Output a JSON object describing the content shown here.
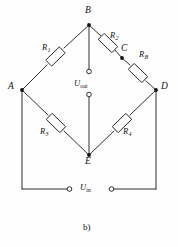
{
  "figure": {
    "kind": "wheatstone-bridge-circuit-diagram",
    "caption": "b)",
    "background_color": "#fefefe",
    "line_color": "#1a1a1a"
  },
  "nodes": [
    {
      "id": "B",
      "label": "B",
      "x": 89,
      "y": 25,
      "label_x": 86,
      "label_y": 7
    },
    {
      "id": "A",
      "label": "A",
      "x": 22,
      "y": 90,
      "label_x": 9,
      "label_y": 83
    },
    {
      "id": "C",
      "label": "C",
      "x": 122,
      "y": 58,
      "label_x": 122,
      "label_y": 46
    },
    {
      "id": "D",
      "label": "D",
      "x": 156,
      "y": 90,
      "label_x": 161,
      "label_y": 83
    },
    {
      "id": "E",
      "label": "E",
      "x": 89,
      "y": 155,
      "label_x": 86,
      "label_y": 158
    }
  ],
  "resistors": [
    {
      "id": "R1",
      "label": "R",
      "sub": "1",
      "label_x": 44,
      "label_y": 46
    },
    {
      "id": "R2",
      "label": "R",
      "sub": "2",
      "label_x": 111,
      "label_y": 33
    },
    {
      "id": "RB",
      "label": "R",
      "sub": "B",
      "label_x": 140,
      "label_y": 52
    },
    {
      "id": "R3",
      "label": "R",
      "sub": "3",
      "label_x": 42,
      "label_y": 129
    },
    {
      "id": "R4",
      "label": "R",
      "sub": "4",
      "label_x": 124,
      "label_y": 129
    }
  ],
  "voltages": [
    {
      "id": "Uout",
      "label": "U",
      "sub": "out",
      "label_x": 75,
      "label_y": 80
    },
    {
      "id": "Uin",
      "label": "U",
      "sub": "in",
      "label_x": 78,
      "label_y": 184
    }
  ],
  "terminals": [
    {
      "id": "uout-top",
      "x": 89,
      "y": 72
    },
    {
      "id": "uout-bottom",
      "x": 89,
      "y": 94
    },
    {
      "id": "uin-left",
      "x": 70,
      "y": 189
    },
    {
      "id": "uin-right",
      "x": 111,
      "y": 189
    }
  ]
}
